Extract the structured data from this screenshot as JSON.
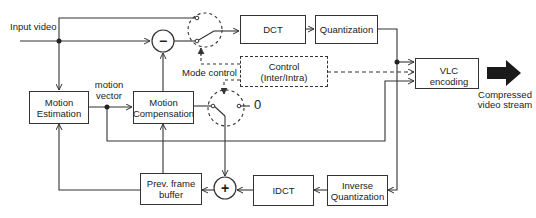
{
  "diagram": {
    "blocks": {
      "dct": "DCT",
      "quantization": "Quantization",
      "vlc": "VLC encoding",
      "control_line1": "Control",
      "control_line2": "(Inter/Intra)",
      "motion_estimation_line1": "Motion",
      "motion_estimation_line2": "Estimation",
      "motion_compensation_line1": "Motion",
      "motion_compensation_line2": "Compensation",
      "prev_frame_line1": "Prev. frame",
      "prev_frame_line2": "buffer",
      "idct": "IDCT",
      "inverse_q_line1": "Inverse",
      "inverse_q_line2": "Quantization"
    },
    "labels": {
      "input": "Input video",
      "mode_control": "Mode control",
      "motion_vector_line1": "motion",
      "motion_vector_line2": "vector",
      "zero": "0",
      "output_line1": "Compressed",
      "output_line2": "video stream"
    },
    "operators": {
      "subtract": "−",
      "add": "+"
    },
    "colors": {
      "stroke": "#333333",
      "background": "#ffffff",
      "output_arrow": "#1a1a1a"
    }
  }
}
